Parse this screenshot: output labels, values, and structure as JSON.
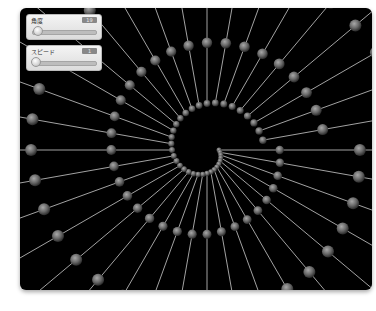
{
  "controls": [
    {
      "label": "角度",
      "value": "19",
      "slider_position": 0.1
    },
    {
      "label": "スピード",
      "value": "1",
      "slider_position": 0.0
    }
  ],
  "canvas": {
    "background": "#000000",
    "line_color": "#d8d8d8",
    "sphere_color": "#8a8a8a",
    "center": [
      187,
      142
    ],
    "rays": 36,
    "spiral": {
      "inner_radius": 12,
      "growth_per_turn": 46,
      "turn_scale": 1.32,
      "max_radius": 260
    }
  }
}
